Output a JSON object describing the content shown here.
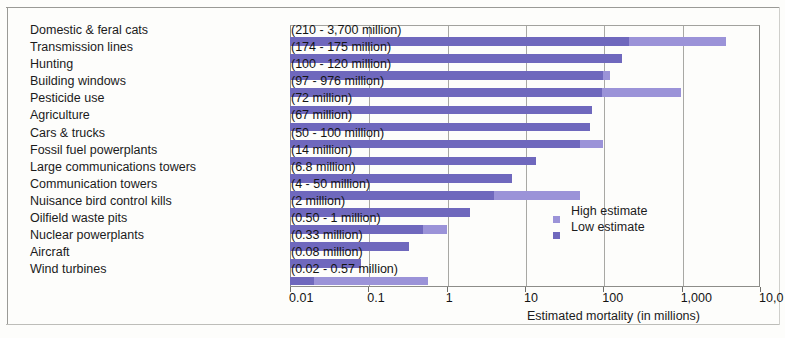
{
  "chart_data": {
    "type": "bar",
    "orientation": "horizontal",
    "title": "",
    "xlabel": "Estimated mortality (in millions)",
    "ylabel": "",
    "xscale": "log",
    "xlim": [
      0.01,
      10000
    ],
    "xticks": [
      0.01,
      0.1,
      1,
      10,
      100,
      1000,
      10000
    ],
    "xticklabels": [
      "0.01",
      "0.1",
      "1",
      "10",
      "100",
      "1,000",
      "10,0"
    ],
    "grid": true,
    "legend_position": "center-right",
    "categories": [
      "Domestic & feral cats",
      "Transmission lines",
      "Hunting",
      "Building windows",
      "Pesticide use",
      "Agriculture",
      "Cars & trucks",
      "Fossil fuel powerplants",
      "Large communications towers",
      "Communication towers",
      "Nuisance bird control kills",
      "Oilfield waste pits",
      "Nuclear powerplants",
      "Aircraft",
      "Wind turbines"
    ],
    "annotations": [
      "(210 - 3,700 million)",
      "(174 - 175 million)",
      "(100 - 120 million)",
      "(97 - 976 million)",
      "(72 million)",
      "(67 million)",
      "(50 - 100 million)",
      "(14 million)",
      "(6.8 million)",
      "(4 - 50 million)",
      "(2 million)",
      "(0.50 - 1 million)",
      "(0.33 million)",
      "(0.08 million)",
      "(0.02 - 0.57 million)"
    ],
    "series": [
      {
        "name": "Low estimate",
        "color": "#6f68bd",
        "values": [
          210,
          174,
          100,
          97,
          72,
          67,
          50,
          14,
          6.8,
          4,
          2,
          0.5,
          0.33,
          0.08,
          0.02
        ]
      },
      {
        "name": "High estimate",
        "color": "#9b93d8",
        "values": [
          3700,
          175,
          120,
          976,
          72,
          67,
          100,
          14,
          6.8,
          50,
          2,
          1,
          0.33,
          0.08,
          0.57
        ]
      }
    ]
  },
  "legend": {
    "high_label": "High estimate",
    "low_label": "Low estimate"
  },
  "axis": {
    "title": "Estimated mortality (in millions)"
  }
}
